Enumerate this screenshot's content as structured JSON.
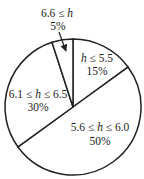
{
  "chart_data": {
    "type": "pie",
    "title": "",
    "title_note": "title clipped at top edge; only a descender fragment visible",
    "start_angle_deg": 0,
    "direction": "clockwise",
    "categories": [
      "h ≤ 5.5",
      "5.6 ≤ h ≤ 6.0",
      "6.1 ≤ h ≤ 6.5",
      "6.6 ≤ h"
    ],
    "values": [
      15,
      50,
      30,
      5
    ],
    "labels": [
      {
        "range_pre": "",
        "var": "h",
        "range_post": " ≤ 5.5",
        "pct": "15%"
      },
      {
        "range_pre": "5.6 ≤ ",
        "var": "h",
        "range_post": " ≤ 6.0",
        "pct": "50%"
      },
      {
        "range_pre": "6.1 ≤ ",
        "var": "h",
        "range_post": " ≤ 6.5",
        "pct": "30%"
      },
      {
        "range_pre": "6.6 ≤ ",
        "var": "h",
        "range_post": "",
        "pct": "5%"
      }
    ],
    "annotations": [
      "arrow from '6.6 ≤ h / 5%' label pointing into the 5% slice"
    ],
    "colors": {
      "stroke": "#222222",
      "fill": "#ffffff",
      "text": "#222222"
    },
    "legend": "none"
  }
}
